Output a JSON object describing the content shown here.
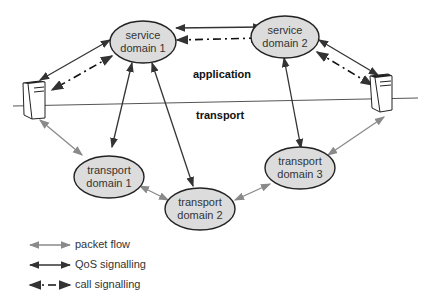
{
  "layers": {
    "application": "application",
    "transport": "transport"
  },
  "nodes": [
    {
      "id": "sd1",
      "line1": "service",
      "line2": "domain 1"
    },
    {
      "id": "sd2",
      "line1": "service",
      "line2": "domain 2"
    },
    {
      "id": "td1",
      "line1": "transport",
      "line2": "domain 1"
    },
    {
      "id": "td2",
      "line1": "transport",
      "line2": "domain 2"
    },
    {
      "id": "td3",
      "line1": "transport",
      "line2": "domain 3"
    }
  ],
  "legend": [
    {
      "label": "packet flow",
      "color": "#8a8a8a"
    },
    {
      "label": "QoS signalling",
      "color": "#333333"
    },
    {
      "label": "call signalling",
      "color": "#111111"
    }
  ],
  "colors": {
    "node_fill": "#dcdcdc",
    "node_stroke": "#222222",
    "packet": "#8a8a8a",
    "qos": "#333333"
  }
}
